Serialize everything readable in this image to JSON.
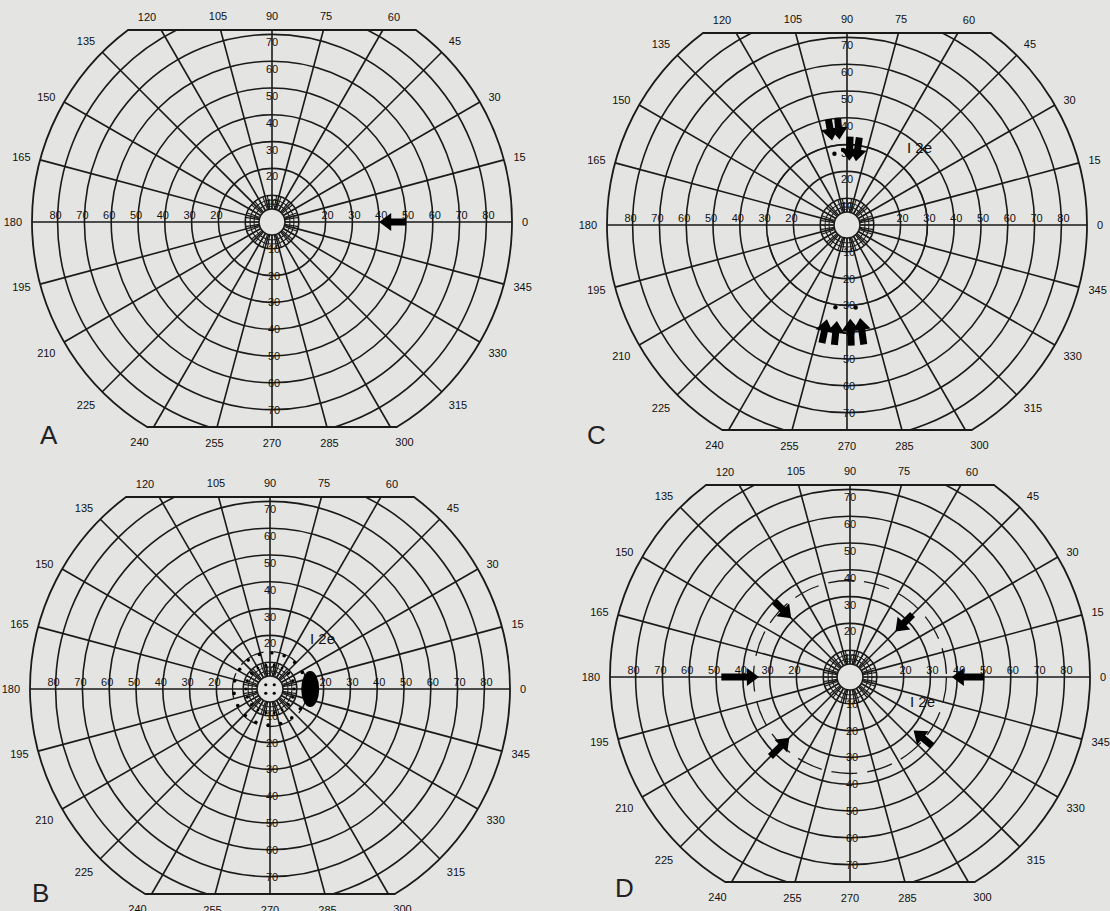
{
  "figure": {
    "background": "#e4e4e2",
    "line_color": "#1a1a1a",
    "scale_px_per_10deg": 26.8,
    "meridian_labels": [
      "0",
      "15",
      "30",
      "45",
      "60",
      "75",
      "90",
      "105",
      "120",
      "135",
      "150",
      "165",
      "180",
      "195",
      "210",
      "225",
      "240",
      "255",
      "270",
      "285",
      "300",
      "315",
      "330",
      "345"
    ],
    "horizontal_ring_labels": [
      "20",
      "30",
      "40",
      "50",
      "60",
      "70",
      "80"
    ],
    "vertical_ring_labels": [
      "10",
      "20",
      "30",
      "40",
      "50",
      "60",
      "70"
    ],
    "isopter_label": "I 2e"
  },
  "panels": [
    {
      "letter": "A",
      "origin": [
        0,
        0
      ],
      "center": [
        272,
        222
      ],
      "isopter": null,
      "arrows": [
        {
          "angle_deg": 0,
          "from_deg": 50,
          "to_deg": 40,
          "note": "single arrow on 0° meridian pointing inward"
        }
      ],
      "dots": [],
      "blind_spot": null
    },
    {
      "letter": "B",
      "origin": [
        0,
        455
      ],
      "center": [
        270,
        234
      ],
      "isopter": {
        "label": "I 2e",
        "radius_deg": 14,
        "label_pos": [
          40,
          -45
        ]
      },
      "arrows": [],
      "dots": "ring of small dots around 10-15° isopter",
      "blind_spot": {
        "angle_deg": 0,
        "ecc_deg": 15,
        "rx": 9,
        "ry": 18
      }
    },
    {
      "letter": "C",
      "origin": [
        555,
        0
      ],
      "center": [
        292,
        225
      ],
      "isopter": {
        "label": "I 2e",
        "radius_deg": 30,
        "label_pos": [
          60,
          -72
        ]
      },
      "arrows": [
        {
          "angle_deg": 100,
          "from_deg": 40,
          "to_deg": 32
        },
        {
          "angle_deg": 95,
          "from_deg": 40,
          "to_deg": 32
        },
        {
          "angle_deg": 88,
          "from_deg": 33,
          "to_deg": 24
        },
        {
          "angle_deg": 82,
          "from_deg": 33,
          "to_deg": 24
        },
        {
          "angle_deg": 258,
          "from_deg": 45,
          "to_deg": 36
        },
        {
          "angle_deg": 264,
          "from_deg": 45,
          "to_deg": 36
        },
        {
          "angle_deg": 272,
          "from_deg": 45,
          "to_deg": 35
        },
        {
          "angle_deg": 278,
          "from_deg": 45,
          "to_deg": 35
        }
      ],
      "dots": "small dots near 25-30° superior and 30° inferior",
      "blind_spot": null
    },
    {
      "letter": "D",
      "origin": [
        555,
        455
      ],
      "center": [
        295,
        222
      ],
      "isopter": {
        "label": "I 2e",
        "radius_deg": 36,
        "label_pos": [
          60,
          30
        ]
      },
      "arrows": [
        {
          "angle_deg": 0,
          "from_deg": 50,
          "to_deg": 38
        },
        {
          "angle_deg": 45,
          "from_deg": 33,
          "to_deg": 24
        },
        {
          "angle_deg": 135,
          "from_deg": 40,
          "to_deg": 31
        },
        {
          "angle_deg": 180,
          "from_deg": 48,
          "to_deg": 34
        },
        {
          "angle_deg": 225,
          "from_deg": 42,
          "to_deg": 32
        },
        {
          "angle_deg": 320,
          "from_deg": 40,
          "to_deg": 31
        }
      ],
      "dots": [],
      "blind_spot": null
    }
  ]
}
